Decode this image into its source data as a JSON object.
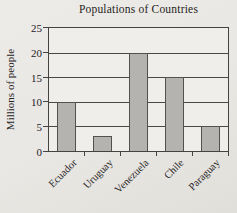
{
  "chart_data": {
    "type": "bar",
    "title": "Populations of Countries",
    "ylabel": "Millions of people",
    "xlabel": "",
    "categories": [
      "Ecuador",
      "Uruguay",
      "Venezuela",
      "Chile",
      "Paraguay"
    ],
    "values": [
      10,
      3,
      20,
      15,
      5
    ],
    "ylim": [
      0,
      25
    ],
    "yticks": [
      0,
      5,
      10,
      15,
      20,
      25
    ],
    "grid": "horizontal",
    "legend": "none",
    "colors": {
      "bar_fill": "#b5b3b0",
      "bar_border": "#53514d",
      "axis": "#454340",
      "plot_background": "#efeeea",
      "page_background": "#e9e7e3",
      "text": "#24221f"
    }
  }
}
